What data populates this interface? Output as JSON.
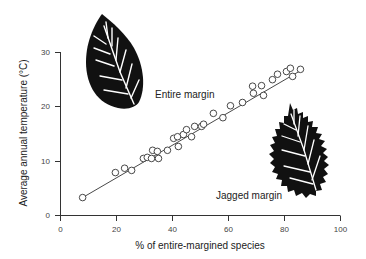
{
  "chart_data": {
    "type": "scatter",
    "title": "",
    "xlabel": "% of entire-margined species",
    "ylabel": "Average annual temperature (°C)",
    "xlim": [
      0,
      100
    ],
    "ylim": [
      0,
      30
    ],
    "xticks": [
      0,
      20,
      40,
      60,
      80,
      100
    ],
    "yticks": [
      0,
      10,
      20,
      30
    ],
    "grid": false,
    "legend": null,
    "series": [
      {
        "name": "Sites",
        "marker": "open-circle",
        "points": [
          [
            7.9,
            3.3
          ],
          [
            19.6,
            7.9
          ],
          [
            22.9,
            8.7
          ],
          [
            25.4,
            8.3
          ],
          [
            29.6,
            10.5
          ],
          [
            31.0,
            10.7
          ],
          [
            32.5,
            10.5
          ],
          [
            32.9,
            12.0
          ],
          [
            34.6,
            11.8
          ],
          [
            35.0,
            10.5
          ],
          [
            38.2,
            12.0
          ],
          [
            40.4,
            14.2
          ],
          [
            41.8,
            14.5
          ],
          [
            42.1,
            12.7
          ],
          [
            43.9,
            14.9
          ],
          [
            45.0,
            15.8
          ],
          [
            46.8,
            14.5
          ],
          [
            47.9,
            16.4
          ],
          [
            50.4,
            16.4
          ],
          [
            51.1,
            16.8
          ],
          [
            54.6,
            18.8
          ],
          [
            58.0,
            18.0
          ],
          [
            60.7,
            20.2
          ],
          [
            65.0,
            20.8
          ],
          [
            68.6,
            23.8
          ],
          [
            68.9,
            22.5
          ],
          [
            71.8,
            23.9
          ],
          [
            72.5,
            22.1
          ],
          [
            75.7,
            25.0
          ],
          [
            77.5,
            26.0
          ],
          [
            80.7,
            26.5
          ],
          [
            82.1,
            27.1
          ],
          [
            82.9,
            25.6
          ],
          [
            85.7,
            26.9
          ]
        ]
      }
    ],
    "fit_line": {
      "x": [
        7.9,
        86.5
      ],
      "y": [
        3.3,
        26.9
      ]
    },
    "annotations": [
      {
        "text": "Entire margin",
        "x": 57,
        "y": 21.5,
        "icon": "smooth-leaf-icon"
      },
      {
        "text": "Jagged margin",
        "x": 71,
        "y": 3.5,
        "icon": "serrated-leaf-icon"
      }
    ],
    "colors": {
      "marker": "#333333",
      "line": "#333333",
      "leaf": "#111111",
      "vein": "#ffffff"
    }
  },
  "labels": {
    "xlabel": "% of entire-margined species",
    "ylabel": "Average annual temperature (°C)",
    "entire": "Entire margin",
    "jagged": "Jagged margin"
  }
}
